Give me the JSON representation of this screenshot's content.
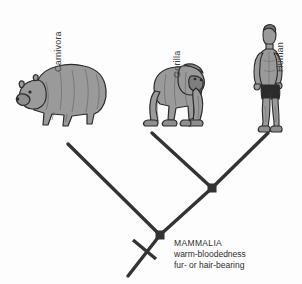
{
  "diagram": {
    "type": "cladogram",
    "background_color": "#fdfdfd",
    "line_color": "#333333",
    "organism_fill": "#9a9a9a",
    "organism_outline": "#2b2b2b"
  },
  "taxa": [
    {
      "label": "Carnivora",
      "icon": "bear-illustration",
      "tip_x": 68,
      "tip_y": 144
    },
    {
      "label": "Gorilla",
      "icon": "gorilla-illustration",
      "tip_x": 152,
      "tip_y": 133
    },
    {
      "label": "Human",
      "icon": "human-illustration",
      "tip_x": 268,
      "tip_y": 133
    }
  ],
  "nodes": [
    {
      "name": "root-node",
      "clade": "MAMMALIA",
      "x": 160,
      "y": 235,
      "marker": "square"
    },
    {
      "name": "gorilla-human-node",
      "clade": "",
      "x": 212,
      "y": 188,
      "marker": "square"
    }
  ],
  "root_stem": {
    "hash_mark": true,
    "x1": 160,
    "y1": 235,
    "x2": 128,
    "y2": 276
  },
  "annotation": {
    "clade_name": "MAMMALIA",
    "trait_1": "warm-bloodedness",
    "trait_2": "fur- or hair-bearing"
  }
}
